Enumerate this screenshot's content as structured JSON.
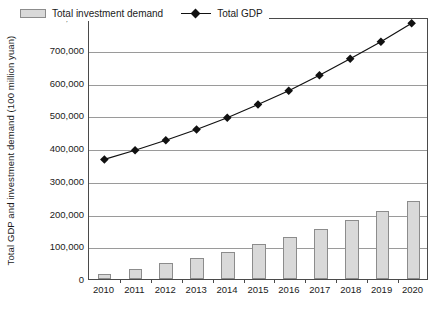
{
  "chart_data": {
    "type": "bar",
    "title": "",
    "xlabel": "",
    "ylabel": "Total GDP and investment demand (100 million yuan)",
    "categories": [
      "2010",
      "2011",
      "2012",
      "2013",
      "2014",
      "2015",
      "2016",
      "2017",
      "2018",
      "2019",
      "2020"
    ],
    "ylim": [
      0,
      800000
    ],
    "ytick_values": [
      0,
      100000,
      200000,
      300000,
      400000,
      500000,
      600000,
      700000,
      800000
    ],
    "ytick_labels": [
      "0",
      "100,000",
      "200,000",
      "300,000",
      "400,000",
      "500,000",
      "600,000",
      "700,000",
      "800,000"
    ],
    "grid": true,
    "legend_position": "top-left",
    "series": [
      {
        "name": "Total investment demand",
        "type": "bar",
        "color": "#d9d9d9",
        "edge_color": "#8c8c8c",
        "values": [
          14000,
          30000,
          48000,
          65000,
          83000,
          106000,
          128000,
          153000,
          181000,
          208000,
          238000
        ]
      },
      {
        "name": "Total GDP",
        "type": "line",
        "color": "#111111",
        "marker": "diamond",
        "values": [
          368000,
          396000,
          427000,
          460000,
          496000,
          537000,
          579000,
          627000,
          678000,
          730000,
          787000
        ]
      }
    ]
  },
  "legend": {
    "items": [
      {
        "label": "Total investment demand",
        "marker": "bar-swatch"
      },
      {
        "label": "Total GDP",
        "marker": "diamond-line"
      }
    ]
  }
}
